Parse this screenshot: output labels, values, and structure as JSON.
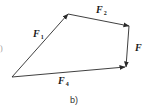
{
  "diagram": {
    "type": "vector-polygon",
    "caption": "b)",
    "edge_fragment": ")",
    "colors": {
      "stroke": "#2a2a2a",
      "text": "#1a1a1a",
      "background": "#ffffff"
    },
    "vertices": {
      "O": [
        12,
        77
      ],
      "A": [
        68,
        14
      ],
      "B": [
        129,
        26
      ],
      "C": [
        126,
        67
      ]
    },
    "vectors": [
      {
        "id": "F1",
        "base": "F",
        "sub": "1",
        "from": "O",
        "to": "A",
        "label_pos": [
          33,
          29
        ]
      },
      {
        "id": "F2",
        "base": "F",
        "sub": "2",
        "from": "A",
        "to": "B",
        "label_pos": [
          96,
          5
        ]
      },
      {
        "id": "F",
        "base": "F",
        "sub": "",
        "from": "B",
        "to": "C",
        "label_pos": [
          135,
          43
        ]
      },
      {
        "id": "F4",
        "base": "F",
        "sub": "4",
        "from": "O",
        "to": "C",
        "label_pos": [
          58,
          76
        ]
      }
    ]
  }
}
